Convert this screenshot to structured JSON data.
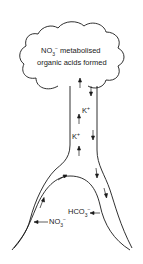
{
  "diagram": {
    "type": "plant ion transport schematic",
    "shoot": {
      "line1_prefix": "NO",
      "line1_sub": "3",
      "line1_sup": "−",
      "line1_rest": " metabolised",
      "line2": "organic acids formed"
    },
    "stem_labels": [
      {
        "ion": "K",
        "charge": "+"
      },
      {
        "ion": "K",
        "charge": "+"
      }
    ],
    "root_labels": {
      "uptake": {
        "ion": "NO",
        "sub": "3",
        "sup": "−",
        "direction": "into root"
      },
      "release": {
        "ion": "HCO",
        "sub": "3",
        "sup": "−",
        "direction": "out of root"
      }
    },
    "colors": {
      "line": "#1a1a1a",
      "background": "#ffffff"
    }
  }
}
